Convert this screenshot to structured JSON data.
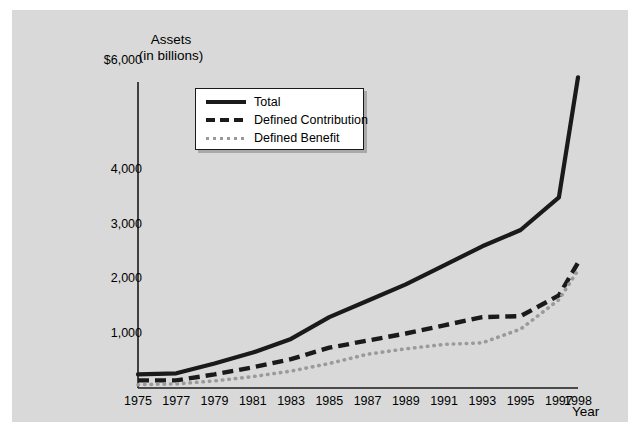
{
  "figure": {
    "background_color": "#ffffff",
    "panel_color": "#d9d9d9"
  },
  "chart_data": {
    "type": "line",
    "title": "",
    "ylabel_line1": "Assets",
    "ylabel_line2": "(in billions)",
    "xlabel": "Year",
    "x": [
      1975,
      1977,
      1979,
      1981,
      1983,
      1985,
      1987,
      1989,
      1991,
      1993,
      1995,
      1997,
      1998
    ],
    "xticklabels": [
      "1975",
      "1977",
      "1979",
      "1981",
      "1983",
      "1985",
      "1987",
      "1989",
      "1991",
      "1993",
      "1995",
      "1997",
      "1998"
    ],
    "ytick_values": [
      1000,
      2000,
      3000,
      4000,
      6000
    ],
    "yticklabels": [
      "1,000",
      "2,000",
      "3,000",
      "4,000",
      "$6,000"
    ],
    "ylim": [
      0,
      6500
    ],
    "xlim": [
      1975,
      1998
    ],
    "grid": false,
    "legend_position": "upper left",
    "series": [
      {
        "name": "Total",
        "style": "solid",
        "color": "#1a1a1a",
        "values": [
          250,
          270,
          450,
          650,
          900,
          1300,
          1600,
          1900,
          2250,
          2600,
          2900,
          3500,
          5700
        ]
      },
      {
        "name": "Defined Contribution",
        "style": "dashed",
        "color": "#1a1a1a",
        "values": [
          140,
          140,
          250,
          380,
          530,
          740,
          870,
          1000,
          1150,
          1300,
          1320,
          1700,
          2300
        ]
      },
      {
        "name": "Defined Benefit",
        "style": "dotted",
        "color": "#9a9a9a",
        "values": [
          60,
          75,
          130,
          210,
          310,
          450,
          620,
          720,
          800,
          830,
          1080,
          1620,
          2160
        ]
      }
    ]
  },
  "legend": {
    "entries": [
      {
        "label": "Total",
        "swatch": "solid-line-swatch"
      },
      {
        "label": "Defined Contribution",
        "swatch": "dashed-line-swatch"
      },
      {
        "label": "Defined Benefit",
        "swatch": "dotted-line-swatch"
      }
    ]
  }
}
